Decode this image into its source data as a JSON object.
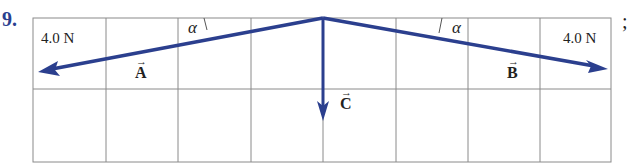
{
  "problem": {
    "number": "9.",
    "cut_off_heading": "above – each in a different",
    "trailing_punct": ";"
  },
  "diagram": {
    "grid": {
      "columns": 8,
      "rows": 2,
      "line_color": "#8a8a8a"
    },
    "arrow_color": "#2b3f8e",
    "vectors": [
      {
        "name": "A",
        "label": "A",
        "magnitude_label": "4.0 N",
        "direction": "left-down"
      },
      {
        "name": "B",
        "label": "B",
        "magnitude_label": "4.0 N",
        "direction": "right-down"
      },
      {
        "name": "C",
        "label": "C",
        "direction": "down"
      }
    ],
    "angle_label": "α",
    "angle_symbol_left": "α",
    "angle_symbol_right": "α"
  }
}
